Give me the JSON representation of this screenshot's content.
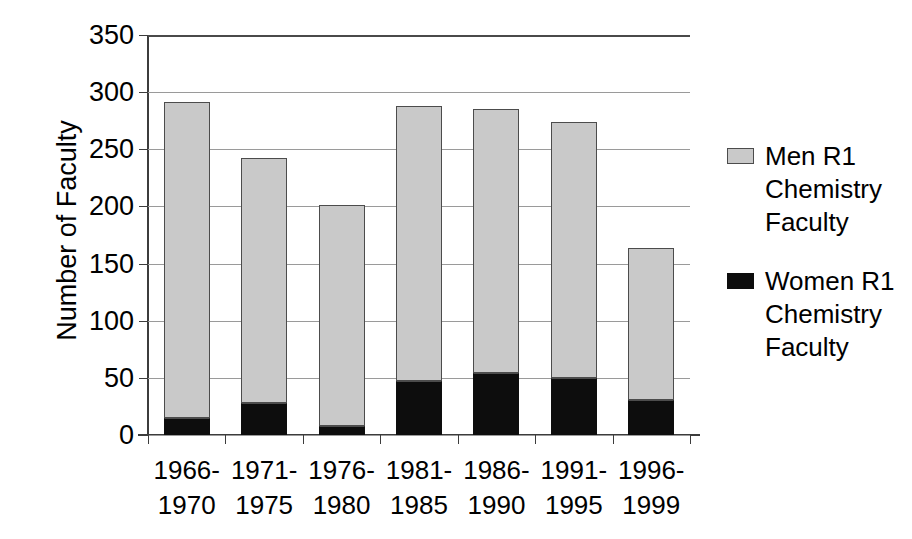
{
  "chart_data": {
    "type": "bar",
    "subtype": "stacked-vertical",
    "title": "",
    "xlabel": "",
    "ylabel": "Number of Faculty",
    "ylim": [
      0,
      350
    ],
    "ytick_step": 50,
    "ytick_labels": [
      "350",
      "300",
      "250",
      "200",
      "150",
      "100",
      "50",
      "0"
    ],
    "grid": true,
    "grid_axis": "y",
    "legend_position": "right",
    "categories": [
      "1966-1970",
      "1971-1975",
      "1976-1980",
      "1981-1985",
      "1986-1990",
      "1991-1995",
      "1996-1999"
    ],
    "category_lines": [
      [
        "1966-",
        "1970"
      ],
      [
        "1971-",
        "1975"
      ],
      [
        "1976-",
        "1980"
      ],
      [
        "1981-",
        "1985"
      ],
      [
        "1986-",
        "1990"
      ],
      [
        "1991-",
        "1995"
      ],
      [
        "1996-",
        "1999"
      ]
    ],
    "series": [
      {
        "name": "Women R1 Chemistry Faculty",
        "name_lines": [
          "Women R1",
          "Chemistry",
          "Faculty"
        ],
        "color": "#0d0d0d",
        "stack_order": 0,
        "values": [
          15,
          28,
          8,
          47,
          54,
          50,
          31
        ]
      },
      {
        "name": "Men R1 Chemistry Faculty",
        "name_lines": [
          "Men R1",
          "Chemistry",
          "Faculty"
        ],
        "color": "#c9c9c9",
        "stack_order": 1,
        "values": [
          276,
          214,
          193,
          241,
          231,
          224,
          133
        ]
      }
    ],
    "totals": [
      291,
      242,
      201,
      288,
      285,
      274,
      164
    ]
  },
  "legend": {
    "entries": [
      {
        "label": "Men R1 Chemistry Faculty",
        "lines": [
          "Men R1",
          "Chemistry",
          "Faculty"
        ],
        "swatch": "men"
      },
      {
        "label": "Women R1 Chemistry Faculty",
        "lines": [
          "Women R1",
          "Chemistry",
          "Faculty"
        ],
        "swatch": "women"
      }
    ]
  },
  "colors": {
    "men": "#c9c9c9",
    "women": "#0d0d0d",
    "axis": "#3c3c3c",
    "gridline": "#9a9a9a",
    "background": "#ffffff"
  }
}
